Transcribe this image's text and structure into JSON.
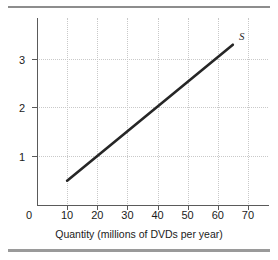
{
  "figure": {
    "top_rule": "",
    "bottom_rule": ""
  },
  "chart_data": {
    "type": "line",
    "title": "",
    "xlabel": "Quantity (millions of DVDs per year)",
    "ylabel": "Price (dollars per DVD)",
    "xlim": [
      0,
      77
    ],
    "ylim": [
      0,
      3.85
    ],
    "grid": true,
    "legend": "none",
    "origin_label": "0",
    "xticks": [
      10,
      20,
      30,
      40,
      50,
      60,
      70
    ],
    "xticklabels": [
      "10",
      "20",
      "30",
      "40",
      "50",
      "60",
      "70"
    ],
    "yticks": [
      1,
      2,
      3
    ],
    "yticklabels": [
      "1",
      "2",
      "3"
    ],
    "series": [
      {
        "name": "S",
        "label": "S",
        "label_text": "S",
        "color": "#262626",
        "x": [
          10,
          65
        ],
        "y": [
          0.5,
          3.3
        ],
        "points": [
          {
            "q": 10,
            "p": 0.5
          },
          {
            "q": 20,
            "p": 1.0
          },
          {
            "q": 30,
            "p": 1.5
          },
          {
            "q": 40,
            "p": 2.0
          },
          {
            "q": 50,
            "p": 2.5
          },
          {
            "q": 60,
            "p": 3.0
          },
          {
            "q": 65,
            "p": 3.3
          }
        ]
      }
    ],
    "annotations": [
      {
        "text": "S",
        "q": 68,
        "p": 3.45
      }
    ]
  }
}
